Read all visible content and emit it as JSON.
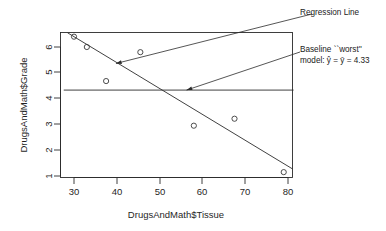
{
  "chart_data": {
    "type": "scatter",
    "title": "",
    "xlabel": "DrugsAndMath$Tissue",
    "ylabel": "DrugsAndMath$Grade",
    "xlim": [
      27.5,
      81.5
    ],
    "ylim": [
      0.85,
      6.6
    ],
    "xticks": [
      30,
      40,
      50,
      60,
      70,
      80
    ],
    "yticks": [
      1,
      2,
      3,
      4,
      5,
      6
    ],
    "grid": false,
    "legend": null,
    "x": [
      30.0,
      33.0,
      37.5,
      45.5,
      58.0,
      67.5,
      79.0
    ],
    "y": [
      6.4,
      6.0,
      4.68,
      5.8,
      2.95,
      3.22,
      1.15
    ],
    "points": [
      {
        "x": 30.0,
        "y": 6.4
      },
      {
        "x": 33.0,
        "y": 6.0
      },
      {
        "x": 37.5,
        "y": 4.68
      },
      {
        "x": 45.5,
        "y": 5.8
      },
      {
        "x": 58.0,
        "y": 2.95
      },
      {
        "x": 67.5,
        "y": 3.22
      },
      {
        "x": 79.0,
        "y": 1.15
      }
    ],
    "lines": [
      {
        "name": "regression-line",
        "x0": 28.5,
        "y0": 6.55,
        "x1": 81.0,
        "y1": 1.28
      },
      {
        "name": "baseline-mean-line",
        "x0": 27.6,
        "y0": 4.33,
        "x1": 81.3,
        "y1": 4.33
      }
    ],
    "annotations": [
      {
        "name": "regression-line-annotation",
        "text": "Regression Line",
        "arrow_to_x": 39.8,
        "arrow_to_y": 5.36
      },
      {
        "name": "baseline-annotation",
        "line1": "Baseline ``worst''",
        "line2_prefix": "model: ",
        "line2_yhat": "ŷ",
        "line2_mid": " = ",
        "line2_ybar": "ȳ",
        "line2_suffix": " = 4.33",
        "value": 4.33,
        "arrow_to_x": 56.3,
        "arrow_to_y": 4.33
      }
    ]
  },
  "tick_labels": {
    "x": [
      "30",
      "40",
      "50",
      "60",
      "70",
      "80"
    ],
    "y": [
      "1",
      "2",
      "3",
      "4",
      "5",
      "6"
    ]
  },
  "axes": {
    "x_title": "DrugsAndMath$Tissue",
    "y_title": "DrugsAndMath$Grade"
  },
  "annotations": {
    "regression": "Regression Line",
    "baseline_line1": "Baseline ``worst''",
    "baseline_line2": "model: ŷ = ȳ = 4.33"
  },
  "colors": {
    "ink": "#2b2b2b",
    "background": "#ffffff",
    "point_stroke": "#3a3a3a"
  }
}
